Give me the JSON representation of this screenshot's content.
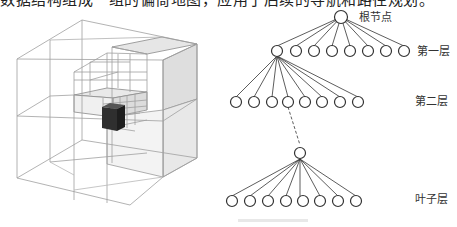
{
  "header": {
    "clipped_text": "数据结构组成一组的偏倚地图，应用于后续的导航和路径规划。"
  },
  "octree": {
    "title": "octree-3d-cube",
    "stroke_color": "#9a9a9a",
    "highlight_face_color": "#e4e4e4",
    "leaf_voxel_color": "#2e2e2e"
  },
  "tree": {
    "labels": {
      "root": "根节点",
      "level1": "第一层",
      "level2": "第二层",
      "leaf": "叶子层"
    },
    "children_per_node": 8,
    "stroke_color": "#333333"
  },
  "caption": {
    "text": ""
  }
}
